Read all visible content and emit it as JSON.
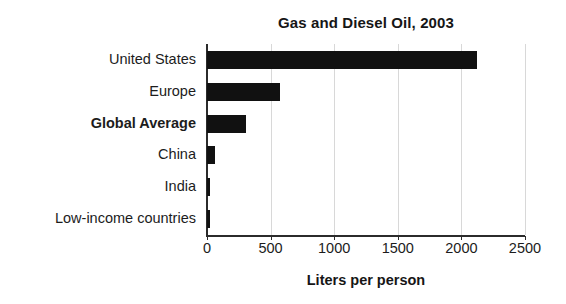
{
  "chart_data": {
    "type": "bar",
    "orientation": "horizontal",
    "title": "Gas and Diesel Oil, 2003",
    "xlabel": "Liters per person",
    "ylabel": "",
    "categories": [
      "United States",
      "Europe",
      "Global Average",
      "China",
      "India",
      "Low-income countries"
    ],
    "values": [
      2120,
      570,
      305,
      63,
      25,
      22
    ],
    "emphasized_categories": [
      "Global Average"
    ],
    "xlim": [
      0,
      2500
    ],
    "xticks": [
      0,
      500,
      1000,
      1500,
      2000,
      2500
    ],
    "xtick_labels": [
      "0",
      "500",
      "1000",
      "1500",
      "2000",
      "2500"
    ],
    "grid": "vertical",
    "legend": "none",
    "bar_color": "#111111",
    "axis_color": "#2b2b2b",
    "gridline_color": "#d8d8d8",
    "background_color": "#ffffff"
  }
}
